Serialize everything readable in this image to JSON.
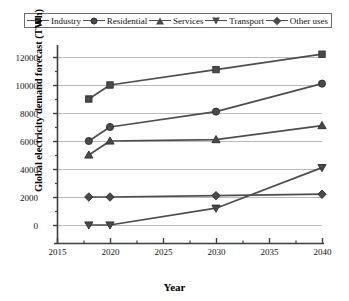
{
  "chart_data": {
    "type": "line",
    "title": "",
    "xlabel": "Year",
    "ylabel": "Global electricity demand forecast (TWh)",
    "x": [
      2018,
      2020,
      2030,
      2040
    ],
    "xlim": [
      2015,
      2040
    ],
    "ylim": [
      0,
      12000
    ],
    "xticks": [
      "2015",
      "2020",
      "2025",
      "2030",
      "2035",
      "2040"
    ],
    "yticks": [
      "0",
      "2000",
      "4000",
      "6000",
      "8000",
      "10000",
      "12000"
    ],
    "grid": "horizontal",
    "legend_position": "top",
    "series": [
      {
        "name": "Industry",
        "marker": "square",
        "values": [
          9000,
          10000,
          11100,
          12200
        ]
      },
      {
        "name": "Residential",
        "marker": "circle",
        "values": [
          6000,
          7000,
          8100,
          10100
        ]
      },
      {
        "name": "Services",
        "marker": "triangle",
        "values": [
          5000,
          6000,
          6100,
          7100
        ]
      },
      {
        "name": "Transport",
        "marker": "triangle-down",
        "values": [
          0,
          0,
          1200,
          4100
        ]
      },
      {
        "name": "Other uses",
        "marker": "diamond",
        "values": [
          2000,
          2000,
          2100,
          2200
        ]
      }
    ],
    "colors": {
      "line": "#4d4d4d",
      "marker_fill": "#4a4a4a",
      "marker_stroke": "#2e2e2e",
      "grid": "#b9b9b9",
      "axis": "#3d3d3d",
      "background": "#ffffff"
    }
  },
  "legend": {
    "items": [
      {
        "label": "Industry",
        "marker": "square"
      },
      {
        "label": "Residential",
        "marker": "circle"
      },
      {
        "label": "Services",
        "marker": "triangle"
      },
      {
        "label": "Transport",
        "marker": "triangle-down"
      },
      {
        "label": "Other uses",
        "marker": "diamond"
      }
    ]
  }
}
